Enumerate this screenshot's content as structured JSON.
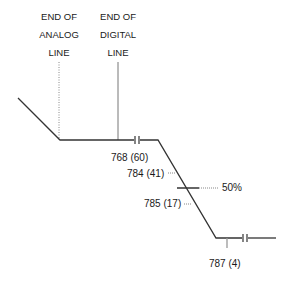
{
  "headers": {
    "analog": {
      "lines": [
        "END OF",
        "ANALOG",
        "LINE"
      ]
    },
    "digital": {
      "lines": [
        "END OF",
        "DIGITAL",
        "LINE"
      ]
    }
  },
  "markers": [
    {
      "label": "768 (60)",
      "code": "768",
      "value": "60"
    },
    {
      "label": "784 (41)",
      "code": "784",
      "value": "41"
    },
    {
      "label": "785 (17)",
      "code": "785",
      "value": "17"
    },
    {
      "label": "787 (4)",
      "code": "787",
      "value": "4"
    }
  ],
  "threshold": {
    "label": "50%"
  },
  "colors": {
    "line": "#333333",
    "dotted": "#888888",
    "text": "#1a1a1a"
  }
}
